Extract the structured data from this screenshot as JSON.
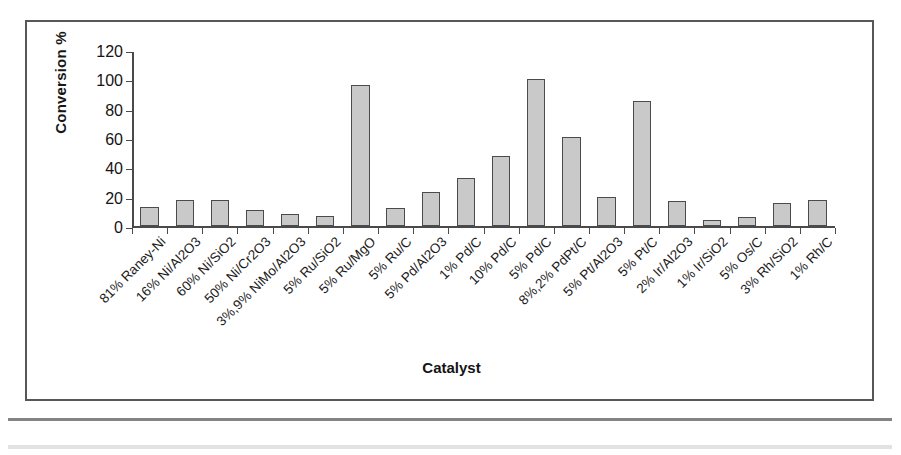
{
  "figure": {
    "y_axis_title": "Conversion %",
    "x_axis_title": "Catalyst"
  },
  "chart_data": {
    "type": "bar",
    "title": "",
    "xlabel": "Catalyst",
    "ylabel": "Conversion %",
    "ylim": [
      0,
      120
    ],
    "yticks": [
      0,
      20,
      40,
      60,
      80,
      100,
      120
    ],
    "grid": false,
    "legend": "none",
    "bar_color": "#c9c9c9",
    "bar_edge_color": "#4b4b4b",
    "categories": [
      "81% Raney-Ni",
      "16% Ni/Al2O3",
      "60% Ni/SiO2",
      "50% Ni/Cr2O3",
      "3%,9% NiMo/Al2O3",
      "5% Ru/SiO2",
      "5% Ru/MgO",
      "5% Ru/C",
      "5% Pd/Al2O3",
      "1% Pd/C",
      "10% Pd/C",
      "5% Pd/C",
      "8%,2% PdPt/C",
      "5% Pt/Al2O3",
      "5% Pt/C",
      "2% Ir/Al2O3",
      "1% Ir/SiO2",
      "5% Os/C",
      "3% Rh/SiO2",
      "1% Rh/C"
    ],
    "values": [
      13,
      18,
      18,
      11,
      8,
      7,
      96,
      12,
      23,
      33,
      48,
      100,
      61,
      20,
      85,
      17,
      4,
      6,
      16,
      18
    ]
  }
}
